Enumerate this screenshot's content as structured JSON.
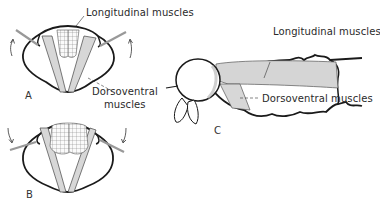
{
  "figure": {
    "panels": [
      {
        "id": "A",
        "label": "A",
        "view": "cross-section, wings up"
      },
      {
        "id": "B",
        "label": "B",
        "view": "cross-section, wings down"
      },
      {
        "id": "C",
        "label": "C",
        "view": "lateral view of thorax"
      }
    ],
    "labels": {
      "a_longitudinal": "Longitudinal muscles",
      "ab_dorsoventral_line1": "Dorsoventral",
      "ab_dorsoventral_line2": "muscles",
      "c_longitudinal": "Longitudinal muscles",
      "c_dorsoventral": "Dorsoventral muscles"
    },
    "colors": {
      "ink": "#1a1a1a",
      "muscle_fill": "#e8e8e8",
      "background": "#ffffff"
    }
  }
}
